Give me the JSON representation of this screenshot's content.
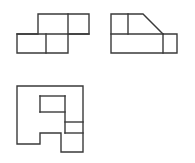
{
  "drawing": {
    "title": "Orthographic multiview projection",
    "description": "Three-view engineering line drawing of a stepped block with a chamfered face",
    "background_color": "#ffffff",
    "line_color": "#3a3a3a",
    "line_width": 1.4,
    "canvas": {
      "width": 195,
      "height": 163
    },
    "views": [
      {
        "id": "view-top",
        "name": "top-view",
        "label": "Top view",
        "origin": {
          "x": 16,
          "y": 13
        },
        "size": {
          "width": 72,
          "height": 39
        },
        "outline_points": "21,0 72,0 72,20 51,20 51,39 0,39 0,20 21,20",
        "internal_edges": [
          {
            "name": "top-horizontal-divider",
            "x1": 0,
            "y1": 20,
            "x2": 72,
            "y2": 20
          },
          {
            "name": "upper-vertical-divider",
            "x1": 51,
            "y1": 0,
            "x2": 51,
            "y2": 20
          },
          {
            "name": "lower-vertical-divider",
            "x1": 29,
            "y1": 20,
            "x2": 29,
            "y2": 39
          }
        ]
      },
      {
        "id": "view-front",
        "name": "front-view",
        "label": "Front view",
        "origin": {
          "x": 110,
          "y": 13
        },
        "size": {
          "width": 66,
          "height": 39
        },
        "outline_points": "0,0 32,0 52,20 66,20 66,39 0,39",
        "internal_edges": [
          {
            "name": "mid-horizontal-edge",
            "x1": 0,
            "y1": 20,
            "x2": 52,
            "y2": 20
          },
          {
            "name": "chamfer-vertical-edge",
            "x1": 17,
            "y1": 0,
            "x2": 17,
            "y2": 20
          },
          {
            "name": "step-vertical-edge",
            "x1": 52,
            "y1": 20,
            "x2": 52,
            "y2": 39
          }
        ]
      },
      {
        "id": "view-side",
        "name": "side-view",
        "label": "Side view",
        "origin": {
          "x": 16,
          "y": 85
        },
        "size": {
          "width": 66,
          "height": 66
        },
        "outline_points": "0,0 66,0 66,66 44,66 44,47 23,47 23,58 0,58",
        "internal_edges": [
          {
            "name": "step-top-horizontal",
            "x1": 23,
            "y1": 10,
            "x2": 48,
            "y2": 10
          },
          {
            "name": "step-left-vertical",
            "x1": 23,
            "y1": 10,
            "x2": 23,
            "y2": 26
          },
          {
            "name": "step-mid-horizontal",
            "x1": 23,
            "y1": 26,
            "x2": 48,
            "y2": 26
          },
          {
            "name": "step-right-vertical",
            "x1": 48,
            "y1": 10,
            "x2": 48,
            "y2": 47
          },
          {
            "name": "pocket-horizontal",
            "x1": 48,
            "y1": 36,
            "x2": 66,
            "y2": 36
          },
          {
            "name": "pocket-lower-edge",
            "x1": 48,
            "y1": 47,
            "x2": 66,
            "y2": 47
          }
        ]
      }
    ]
  }
}
